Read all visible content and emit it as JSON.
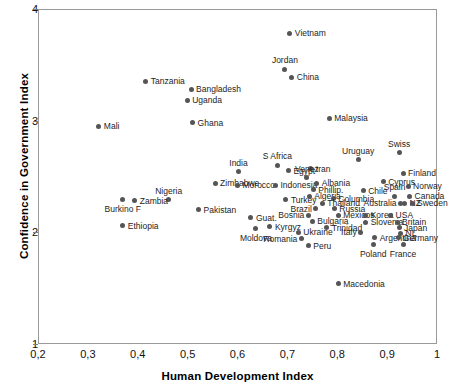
{
  "chart_data": {
    "type": "scatter",
    "title": "",
    "xlabel": "Human Development Index",
    "ylabel": "Confidence in Government Index",
    "xlim": [
      0.2,
      1.0
    ],
    "ylim": [
      1,
      4
    ],
    "xticks": [
      "0,2",
      "0,3",
      "0,4",
      "0,5",
      "0,6",
      "0,7",
      "0,8",
      "0,9",
      "1"
    ],
    "xtick_values": [
      0.2,
      0.3,
      0.4,
      0.5,
      0.6,
      0.7,
      0.8,
      0.9,
      1.0
    ],
    "yticks": [
      "4",
      "3",
      "2",
      "1"
    ],
    "ytick_values": [
      4,
      3,
      2,
      1
    ],
    "grid": false,
    "legend": false,
    "marker_color": "#555555",
    "frame_color": "#9a9a9a",
    "points": [
      {
        "label": "Vietnam",
        "x": 0.703,
        "y": 3.79,
        "pos": "right"
      },
      {
        "label": "Tanzania",
        "x": 0.414,
        "y": 3.36,
        "pos": "right"
      },
      {
        "label": "Jordan",
        "x": 0.693,
        "y": 3.47,
        "pos": "above"
      },
      {
        "label": "China",
        "x": 0.707,
        "y": 3.4,
        "pos": "right"
      },
      {
        "label": "Bangladesh",
        "x": 0.505,
        "y": 3.29,
        "pos": "right"
      },
      {
        "label": "Uganda",
        "x": 0.497,
        "y": 3.19,
        "pos": "right"
      },
      {
        "label": "Mali",
        "x": 0.32,
        "y": 2.96,
        "pos": "right"
      },
      {
        "label": "Ghana",
        "x": 0.508,
        "y": 2.99,
        "pos": "right"
      },
      {
        "label": "Malaysia",
        "x": 0.782,
        "y": 3.03,
        "pos": "right"
      },
      {
        "label": "Swiss",
        "x": 0.922,
        "y": 2.72,
        "pos": "above"
      },
      {
        "label": "Uruguay",
        "x": 0.84,
        "y": 2.66,
        "pos": "above"
      },
      {
        "label": "S Africa",
        "x": 0.678,
        "y": 2.61,
        "pos": "above"
      },
      {
        "label": "India",
        "x": 0.6,
        "y": 2.55,
        "pos": "above"
      },
      {
        "label": "Egypt",
        "x": 0.7,
        "y": 2.56,
        "pos": "right"
      },
      {
        "label": "Iran",
        "x": 0.745,
        "y": 2.58,
        "pos": "right"
      },
      {
        "label": "Finland",
        "x": 0.93,
        "y": 2.54,
        "pos": "right"
      },
      {
        "label": "Cyprus",
        "x": 0.89,
        "y": 2.46,
        "pos": "right"
      },
      {
        "label": "Venez",
        "x": 0.737,
        "y": 2.5,
        "pos": "above"
      },
      {
        "label": "Zimbabwe",
        "x": 0.553,
        "y": 2.45,
        "pos": "right"
      },
      {
        "label": "Morocco",
        "x": 0.598,
        "y": 2.43,
        "pos": "right"
      },
      {
        "label": "Indonesia",
        "x": 0.674,
        "y": 2.43,
        "pos": "right"
      },
      {
        "label": "Albania",
        "x": 0.757,
        "y": 2.45,
        "pos": "right"
      },
      {
        "label": "Norway",
        "x": 0.94,
        "y": 2.42,
        "pos": "right"
      },
      {
        "label": "Nigeria",
        "x": 0.46,
        "y": 2.3,
        "pos": "above"
      },
      {
        "label": "Phillip.",
        "x": 0.75,
        "y": 2.39,
        "pos": "right"
      },
      {
        "label": "Chile",
        "x": 0.85,
        "y": 2.38,
        "pos": "right"
      },
      {
        "label": "Spain",
        "x": 0.913,
        "y": 2.33,
        "pos": "above"
      },
      {
        "label": "Canada",
        "x": 0.943,
        "y": 2.33,
        "pos": "right"
      },
      {
        "label": "Turkey",
        "x": 0.695,
        "y": 2.3,
        "pos": "right"
      },
      {
        "label": "Algeria",
        "x": 0.742,
        "y": 2.33,
        "pos": "right"
      },
      {
        "label": "Columbia",
        "x": 0.79,
        "y": 2.31,
        "pos": "right"
      },
      {
        "label": "Australia",
        "x": 0.925,
        "y": 2.27,
        "pos": "left"
      },
      {
        "label": "NZ",
        "x": 0.933,
        "y": 2.27,
        "pos": "right"
      },
      {
        "label": "Sweden",
        "x": 0.948,
        "y": 2.27,
        "pos": "right"
      },
      {
        "label": "Zambia",
        "x": 0.392,
        "y": 2.29,
        "pos": "right"
      },
      {
        "label": "Burkino F",
        "x": 0.368,
        "y": 2.3,
        "pos": "below"
      },
      {
        "label": "Thailand",
        "x": 0.768,
        "y": 2.27,
        "pos": "right"
      },
      {
        "label": "Brazil",
        "x": 0.755,
        "y": 2.22,
        "pos": "left"
      },
      {
        "label": "Russia",
        "x": 0.792,
        "y": 2.22,
        "pos": "right"
      },
      {
        "label": "Pakistan",
        "x": 0.52,
        "y": 2.21,
        "pos": "right"
      },
      {
        "label": "Bosnia",
        "x": 0.74,
        "y": 2.16,
        "pos": "left"
      },
      {
        "label": "Mexicos",
        "x": 0.8,
        "y": 2.16,
        "pos": "right"
      },
      {
        "label": "Korea",
        "x": 0.855,
        "y": 2.16,
        "pos": "right"
      },
      {
        "label": "USA",
        "x": 0.905,
        "y": 2.16,
        "pos": "right"
      },
      {
        "label": "Guat.",
        "x": 0.625,
        "y": 2.14,
        "pos": "right"
      },
      {
        "label": "Bulgaria",
        "x": 0.748,
        "y": 2.11,
        "pos": "right"
      },
      {
        "label": "Slovenia",
        "x": 0.855,
        "y": 2.1,
        "pos": "right"
      },
      {
        "label": "Britain",
        "x": 0.918,
        "y": 2.1,
        "pos": "right"
      },
      {
        "label": "Ethiopia",
        "x": 0.368,
        "y": 2.07,
        "pos": "right"
      },
      {
        "label": "Kyrgyz",
        "x": 0.663,
        "y": 2.06,
        "pos": "right"
      },
      {
        "label": "Trinidad",
        "x": 0.777,
        "y": 2.05,
        "pos": "right"
      },
      {
        "label": "Japan",
        "x": 0.922,
        "y": 2.05,
        "pos": "right"
      },
      {
        "label": "Moldova",
        "x": 0.635,
        "y": 2.04,
        "pos": "below"
      },
      {
        "label": "Ukraine",
        "x": 0.72,
        "y": 2.01,
        "pos": "right"
      },
      {
        "label": "Italy",
        "x": 0.845,
        "y": 2.01,
        "pos": "left"
      },
      {
        "label": "NL",
        "x": 0.925,
        "y": 2.0,
        "pos": "right"
      },
      {
        "label": "Romania",
        "x": 0.726,
        "y": 1.95,
        "pos": "left"
      },
      {
        "label": "Argentina",
        "x": 0.873,
        "y": 1.96,
        "pos": "right"
      },
      {
        "label": "Germany",
        "x": 0.92,
        "y": 1.96,
        "pos": "right"
      },
      {
        "label": "Peru",
        "x": 0.74,
        "y": 1.89,
        "pos": "right"
      },
      {
        "label": "Poland",
        "x": 0.87,
        "y": 1.9,
        "pos": "below"
      },
      {
        "label": "France",
        "x": 0.93,
        "y": 1.9,
        "pos": "below"
      },
      {
        "label": "Macedonia",
        "x": 0.8,
        "y": 1.55,
        "pos": "right"
      }
    ]
  }
}
